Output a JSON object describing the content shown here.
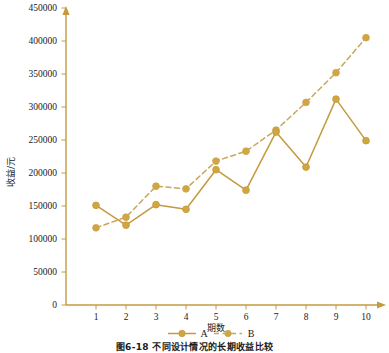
{
  "figure": {
    "caption": "图6-18  不同设计情况的长期收益比较",
    "accent_color": "#C49A3F",
    "marker_color": "#D1A63F",
    "background": "#FFFFFF"
  },
  "chart_data": {
    "type": "line",
    "title": "",
    "xlabel": "期数",
    "ylabel": "收益/元",
    "categories": [
      "1",
      "2",
      "3",
      "4",
      "5",
      "6",
      "7",
      "8",
      "9",
      "10"
    ],
    "x": [
      1,
      2,
      3,
      4,
      5,
      6,
      7,
      8,
      9,
      10
    ],
    "xlim": [
      1,
      10
    ],
    "ylim": [
      0,
      450000
    ],
    "yticks": [
      0,
      50000,
      100000,
      150000,
      200000,
      250000,
      300000,
      350000,
      400000,
      450000
    ],
    "ytick_labels": [
      "0",
      "50000",
      "100000",
      "150000",
      "200000",
      "250000",
      "300000",
      "350000",
      "400000",
      "450000"
    ],
    "xtick_labels": [
      "1",
      "2",
      "3",
      "4",
      "5",
      "6",
      "7",
      "8",
      "9",
      "10"
    ],
    "grid": false,
    "legend_position": "bottom",
    "series": [
      {
        "name": "A",
        "style": "solid",
        "marker": "circle",
        "color": "#C49A3F",
        "values": [
          151000,
          121000,
          152000,
          145000,
          205000,
          174000,
          262000,
          209000,
          312000,
          249000
        ]
      },
      {
        "name": "B",
        "style": "dashed",
        "marker": "circle",
        "color": "#C9A658",
        "values": [
          117000,
          133000,
          180000,
          176000,
          218000,
          233000,
          265000,
          307000,
          352000,
          405000
        ]
      }
    ]
  },
  "legend": {
    "items": [
      {
        "label": "A",
        "style": "solid"
      },
      {
        "label": "B",
        "style": "dashed"
      }
    ]
  }
}
